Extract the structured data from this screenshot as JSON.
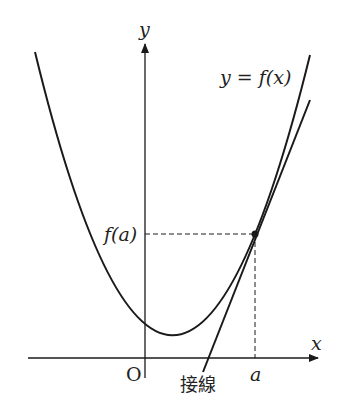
{
  "figure": {
    "y_axis_label": "y",
    "x_axis_label": "x",
    "origin_label": "O",
    "curve_label": "y = f(x)",
    "point_y_label": "f(a)",
    "point_x_label": "a",
    "tangent_label": "接線",
    "colors": {
      "stroke": "#1a1a1a",
      "text": "#222222"
    }
  }
}
